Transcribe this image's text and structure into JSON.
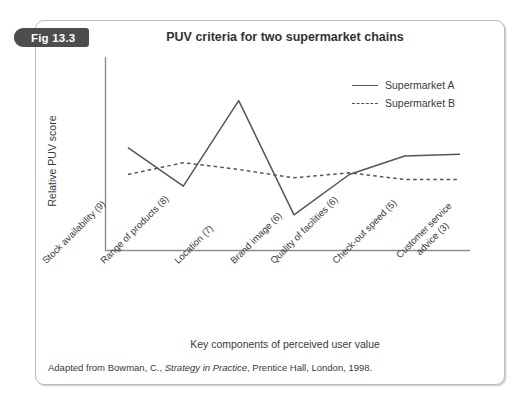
{
  "figure": {
    "badge_label": "Fig 13.3",
    "source_note_prefix": "Adapted from Bowman, C., ",
    "source_note_italic": "Strategy in Practice",
    "source_note_suffix": ", Prentice Hall, London, 1998."
  },
  "legend": {
    "entries": [
      {
        "label": "Supermarket A",
        "style": "solid"
      },
      {
        "label": "Supermarket B",
        "style": "dashed"
      }
    ]
  },
  "chart_data": {
    "type": "line",
    "title": "PUV criteria for two supermarket chains",
    "xlabel": "Key components of perceived user value",
    "ylabel": "Relative PUV score",
    "grid": false,
    "legend_position": "top-right",
    "categories": [
      "Stock availability (9)",
      "Range of products (8)",
      "Location (7)",
      "Brand image (6)",
      "Quality of facilities (6)",
      "Check-out speed (5)",
      "Customer service advice (3)"
    ],
    "ylim": [
      0,
      10
    ],
    "xlim": [
      0,
      6
    ],
    "axis_ticks_shown": false,
    "series": [
      {
        "name": "Supermarket A",
        "style": "solid",
        "color": "#555555",
        "values": [
          5.5,
          3.2,
          8.3,
          1.5,
          3.9,
          5.0,
          5.1
        ]
      },
      {
        "name": "Supermarket B",
        "style": "dashed",
        "color": "#555555",
        "values": [
          3.9,
          4.6,
          4.2,
          3.7,
          4.0,
          3.6,
          3.6
        ]
      }
    ]
  }
}
